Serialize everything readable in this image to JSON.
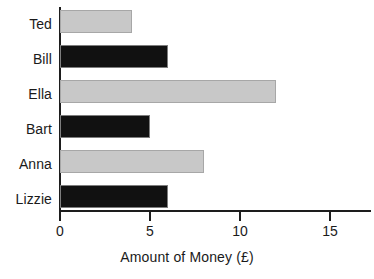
{
  "chart_data": {
    "type": "bar",
    "orientation": "horizontal",
    "title": "",
    "xlabel": "Amount of Money (£)",
    "ylabel": "",
    "categories": [
      "Ted",
      "Bill",
      "Ella",
      "Bart",
      "Anna",
      "Lizzie"
    ],
    "values": [
      4,
      6,
      12,
      5,
      8,
      6
    ],
    "bar_colors": [
      "#c8c8c8",
      "#111111",
      "#c8c8c8",
      "#111111",
      "#c8c8c8",
      "#111111"
    ],
    "xlim": [
      0,
      16.9
    ],
    "xticks": [
      0,
      5,
      10,
      15
    ],
    "xtick_labels": [
      "0",
      "5",
      "10",
      "15"
    ],
    "grid": false,
    "legend": null,
    "series": [
      {
        "name": "Amount of Money (£)",
        "points": [
          {
            "category": "Ted",
            "value": 4,
            "color": "#c8c8c8"
          },
          {
            "category": "Bill",
            "value": 6,
            "color": "#111111"
          },
          {
            "category": "Ella",
            "value": 12,
            "color": "#c8c8c8"
          },
          {
            "category": "Bart",
            "value": 5,
            "color": "#111111"
          },
          {
            "category": "Anna",
            "value": 8,
            "color": "#c8c8c8"
          },
          {
            "category": "Lizzie",
            "value": 6,
            "color": "#111111"
          }
        ]
      }
    ]
  },
  "colors": {
    "axis": "#1d1d1d",
    "gray_bar": "#c8c8c8",
    "black_bar": "#111111",
    "bar_border": "#9a9a9a",
    "background": "#ffffff",
    "text": "#1a1a1a"
  },
  "axis": {
    "x_title": "Amount of Money (£)",
    "ticks": [
      {
        "label": "0"
      },
      {
        "label": "5"
      },
      {
        "label": "10"
      },
      {
        "label": "15"
      }
    ]
  },
  "categories": [
    {
      "label": "Ted"
    },
    {
      "label": "Bill"
    },
    {
      "label": "Ella"
    },
    {
      "label": "Bart"
    },
    {
      "label": "Anna"
    },
    {
      "label": "Lizzie"
    }
  ]
}
